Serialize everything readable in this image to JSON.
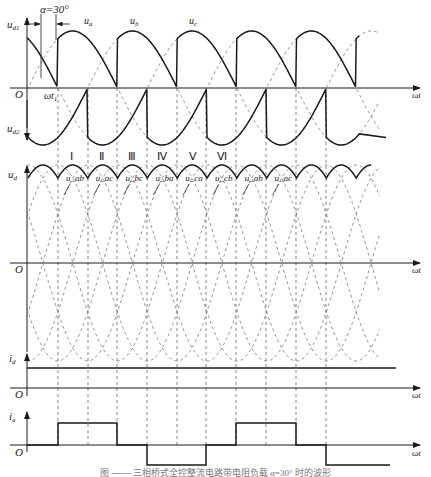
{
  "figure": {
    "caption": "图 ─── 三相桥式全控整流电路带电阻负载 α=30° 时的波形",
    "alpha_label": "α=30°",
    "axis_x_label": "ωt",
    "origin_label": "O",
    "wt1_label": "ωt₁"
  },
  "panels": {
    "top": {
      "y_label_upper": "u_d1",
      "y_label_lower": "u_d2",
      "phase_labels": [
        "u_a",
        "u_b",
        "u_c"
      ]
    },
    "middle": {
      "y_label": "u_d",
      "intervals": [
        "Ⅰ",
        "Ⅱ",
        "Ⅲ",
        "Ⅳ",
        "Ⅴ",
        "Ⅵ"
      ],
      "line_voltage_labels": [
        "u_ab",
        "u_ac",
        "u_bc",
        "u_ba",
        "u_ca",
        "u_cb",
        "u_ab",
        "u_ac"
      ]
    },
    "id": {
      "y_label": "i_d"
    },
    "ia": {
      "y_label": "i_a"
    }
  },
  "colors": {
    "line": "#1a1a1a",
    "dashed": "#555555",
    "background": "#ffffff"
  }
}
